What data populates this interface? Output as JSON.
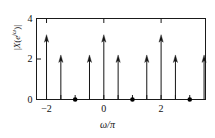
{
  "figure": {
    "axis_color": "#1a1a1a",
    "stem_color": "#151515",
    "marker_color": "#000000",
    "background": "#ffffff"
  },
  "labels": {
    "ylabel_plain": "|X(e^{jw})|",
    "ylabel_parts": {
      "pre": "|X(e",
      "sup_j": "j",
      "sup_w": "ω",
      "post": ")|"
    },
    "xlabel": "ω/π",
    "ytick_texts": [
      "0",
      "2",
      "4"
    ],
    "xtick_texts": [
      "−2",
      "0",
      "2"
    ]
  },
  "chart_data": {
    "type": "line",
    "subtype": "stem-impulse",
    "title": "",
    "xlabel": "ω/π",
    "ylabel": "|X(e^{jω})|",
    "xlim": [
      -2.35,
      3.55
    ],
    "ylim": [
      0,
      4
    ],
    "grid": false,
    "legend": null,
    "xticks": [
      -2,
      0,
      2
    ],
    "xticklabels": [
      "−2",
      "0",
      "2"
    ],
    "xticks_minor": [
      -1.5,
      -1,
      -0.5,
      0.5,
      1,
      1.5,
      2.5,
      3
    ],
    "yticks": [
      0,
      2,
      4
    ],
    "yticklabels": [
      "0",
      "2",
      "4"
    ],
    "impulses": [
      {
        "x": -2.0,
        "height": 3.2,
        "arrow": true
      },
      {
        "x": -1.5,
        "height": 2.2,
        "arrow": true
      },
      {
        "x": -0.5,
        "height": 2.2,
        "arrow": true
      },
      {
        "x": 0.0,
        "height": 3.2,
        "arrow": true
      },
      {
        "x": 0.5,
        "height": 2.2,
        "arrow": true
      },
      {
        "x": 1.5,
        "height": 2.2,
        "arrow": true
      },
      {
        "x": 2.0,
        "height": 3.2,
        "arrow": true
      },
      {
        "x": 2.5,
        "height": 2.2,
        "arrow": true
      },
      {
        "x": 3.5,
        "height": 2.2,
        "arrow": true
      }
    ],
    "zero_points": [
      {
        "x": -1.0,
        "y": 0
      },
      {
        "x": 1.0,
        "y": 0
      },
      {
        "x": 3.0,
        "y": 0
      }
    ]
  }
}
